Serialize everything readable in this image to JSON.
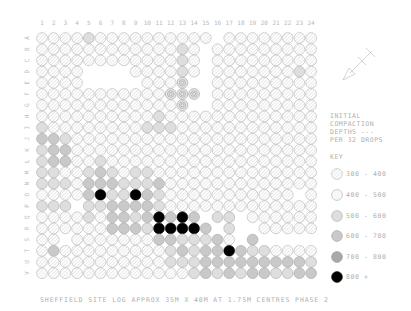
{
  "title_caption": "SHEFFIELD SITE LOG APPROX 35M X 40M AT 1.75M CENTRES    PHASE 2",
  "legend": {
    "heading_lines": [
      "INITIAL",
      "COMPACTION",
      "DEPTHS ---",
      "PER 32 DROPS"
    ],
    "key_label": "KEY",
    "items": [
      {
        "code": "h",
        "label": "300 - 400",
        "fill": "#ededed",
        "stroke": "#b5b5b5",
        "pattern": "hatch"
      },
      {
        "code": "d",
        "label": "400 - 500",
        "fill": "#e9e9e9",
        "stroke": "#aaaaaa",
        "pattern": "dots"
      },
      {
        "code": "l",
        "label": "500 - 600",
        "fill": "#dedede",
        "stroke": "#aaaaaa",
        "pattern": "solid"
      },
      {
        "code": "m",
        "label": "600 - 700",
        "fill": "#c9c9c9",
        "stroke": "#a5a5a5",
        "pattern": "solid"
      },
      {
        "code": "g",
        "label": "700 - 800",
        "fill": "#a9a9a9",
        "stroke": "#8f8f8f",
        "pattern": "solid"
      },
      {
        "code": "k",
        "label": "800 +",
        "fill": "#000000",
        "stroke": "#000000",
        "pattern": "solid"
      }
    ]
  },
  "compass": {
    "icon": "north-arrow-icon",
    "label": "N"
  },
  "columns": [
    "1",
    "2",
    "3",
    "4",
    "5",
    "6",
    "7",
    "8",
    "9",
    "10",
    "11",
    "12",
    "13",
    "14",
    "15",
    "16",
    "17",
    "18",
    "19",
    "20",
    "21",
    "22",
    "23",
    "24"
  ],
  "rows": [
    "A",
    "B",
    "C",
    "D",
    "E",
    "F",
    "G",
    "H",
    "I",
    "J",
    "K",
    "L",
    "M",
    "N",
    "O",
    "P",
    "Q",
    "R",
    "S",
    "T",
    "U",
    "V"
  ],
  "grid": [
    "hhhhlhhhhhhhhhh.hhhhhhhh",
    "hhhhhhhhhhhhlh.hhhhhhhhh",
    "hhhhhhhhhhhhlh.hhhhhhhhh",
    "hhhh....hhhhlh.hhhhhhhlh",
    "hhhh.....hhhr..hhhhhhhhh",
    "hhhhhhhhhhhrrr.hhhhhhhhh",
    "hhhhhhhhhhhhr..hhhhhhhhh",
    "hhhhhhhhhhlhhhhhhhhhhhhh",
    "lhhhhhhhhlllhhhhhhhhhhhh",
    "mmlhhhhhhhhhhhhhhhhhhhhh",
    "lmmhhhhhhhhhhhhhhhhhhhhh",
    "lmmhhlhhhhhhhhhhhhhhhhhh",
    "llhhlmlhllhhhhhhhhhhhhhh",
    "lllhmmmlllmhhhhhhhhhhhhh",
    "hhhhmkllkmlhhhhhhhhhhh.h",
    "lll.llmmmmlhhhhhhhhhhhhh",
    "hhhhlhmmlmkmkm.ll.hhhhhh",
    "hhhhhhmmmlkkkkm.l..hhhhh",
    "hh.hhhhhhhmmlllmh.m.....",
    "hmhhhhhhhhhlmlmmkmllhhhh",
    "hhhhhhhhhhhlllmmmmmmmmml",
    "hhhhhhhhhhhhhlmlmlmmllmm"
  ],
  "annotations": {
    "col1_mark": "*",
    "col4_mark": "*"
  }
}
